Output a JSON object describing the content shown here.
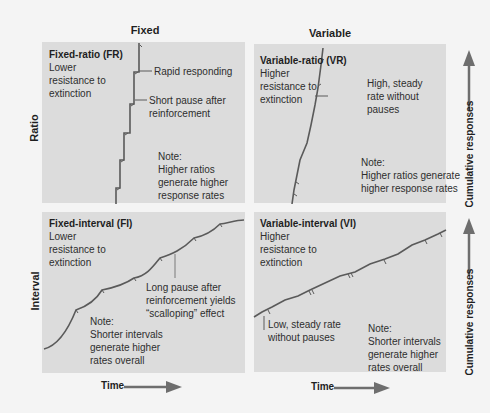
{
  "columns": {
    "fixed": "Fixed",
    "variable": "Variable"
  },
  "rows": {
    "ratio": "Ratio",
    "interval": "Interval"
  },
  "axes": {
    "y_label": "Cumulative responses",
    "x_label": "Time"
  },
  "colors": {
    "panel": "#dcdcdc",
    "curve": "#5a5a5a",
    "arrow": "#6e6e6e",
    "background": "#f4f4f4"
  },
  "panels": {
    "fixed_ratio": {
      "title": "Fixed-ratio (FR)",
      "description": "Lower\nresistance to\nextinction",
      "annotations": [
        "Rapid responding",
        "Short pause after\nreinforcement"
      ],
      "note": "Note:\nHigher ratios\ngenerate higher\nresponse rates"
    },
    "variable_ratio": {
      "title": "Variable-ratio (VR)",
      "description": "Higher\nresistance to\nextinction",
      "annotations": [
        "High, steady\nrate without\npauses"
      ],
      "note": "Note:\nHigher ratios generate\nhigher response rates"
    },
    "fixed_interval": {
      "title": "Fixed-interval (FI)",
      "description": "Lower\nresistance to\nextinction",
      "annotations": [
        "Long pause after\nreinforcement yields\n“scalloping” effect"
      ],
      "note": "Note:\nShorter intervals\ngenerate higher\nrates overall"
    },
    "variable_interval": {
      "title": "Variable-interval (VI)",
      "description": "Higher\nresistance to\nextinction",
      "annotations": [
        "Low, steady rate\nwithout pauses"
      ],
      "note": "Note:\nShorter intervals\ngenerate higher\nrates overall"
    }
  }
}
